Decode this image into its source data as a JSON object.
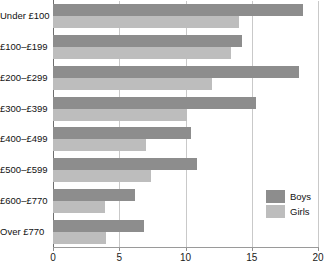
{
  "chart_data": {
    "type": "bar",
    "orientation": "horizontal",
    "title": "",
    "subtitle": "",
    "xlabel": "",
    "ylabel": "",
    "xlim": [
      0,
      20
    ],
    "ylim": null,
    "grid": true,
    "grid_axis": "x",
    "legend_position": "bottom-right",
    "categories": [
      "Under £100",
      "£100–£199",
      "£200–£299",
      "£300–£399",
      "£400–£499",
      "£500–£599",
      "£600–£770",
      "Over £770"
    ],
    "xticks": [
      0,
      5,
      10,
      15,
      20
    ],
    "xtick_labels": [
      "0",
      "5",
      "10",
      "15",
      "20"
    ],
    "series": [
      {
        "name": "Boys",
        "color": "#8d8d8d",
        "values": [
          18.9,
          14.3,
          18.6,
          15.3,
          10.4,
          10.9,
          6.2,
          6.9
        ]
      },
      {
        "name": "Girls",
        "color": "#bdbdbd",
        "values": [
          14.0,
          13.4,
          12.0,
          10.1,
          7.0,
          7.4,
          3.9,
          4.0
        ]
      }
    ]
  },
  "legend": {
    "items": [
      {
        "label": "Boys",
        "color": "#8d8d8d"
      },
      {
        "label": "Girls",
        "color": "#bdbdbd"
      }
    ]
  },
  "colors": {
    "boys": "#8d8d8d",
    "girls": "#bdbdbd",
    "axis": "#6f6f6f",
    "grid": "#c9c9c9",
    "text": "#111111",
    "background": "#ffffff"
  }
}
